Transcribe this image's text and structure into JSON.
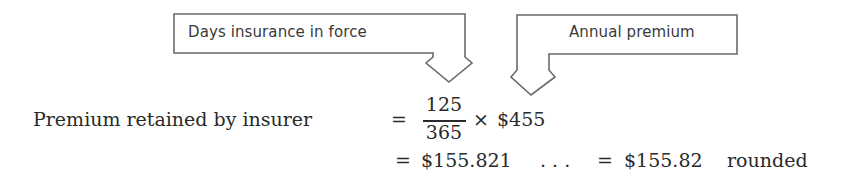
{
  "callouts": {
    "left": {
      "label": "Days insurance in force"
    },
    "right": {
      "label": "Annual premium"
    }
  },
  "equation": {
    "lhs": "Premium retained by insurer",
    "equals": "=",
    "numerator": "125",
    "denominator": "365",
    "times": "×",
    "premium": "$455",
    "line2_equals": "=",
    "exact_value": "$155.821",
    "ellipsis": ". . .",
    "line2_equals_2": "=",
    "rounded_value": "$155.82",
    "rounded_note": "rounded"
  },
  "colors": {
    "stroke": "#6a6a6a",
    "text": "#2a2a2a"
  }
}
